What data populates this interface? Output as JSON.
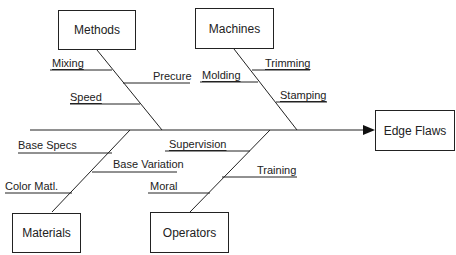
{
  "diagram": {
    "type": "fishbone",
    "effect": "Edge Flaws",
    "categories": [
      {
        "name": "Methods",
        "causes": [
          "Mixing",
          "Precure",
          "Speed"
        ]
      },
      {
        "name": "Machines",
        "causes": [
          "Trimming",
          "Molding",
          "Stamping"
        ]
      },
      {
        "name": "Materials",
        "causes": [
          "Base Specs",
          "Base Variation",
          "Color Matl."
        ]
      },
      {
        "name": "Operators",
        "causes": [
          "Supervision",
          "Training",
          "Moral"
        ]
      }
    ]
  },
  "colors": {
    "line": "#222222",
    "background": "#ffffff"
  }
}
